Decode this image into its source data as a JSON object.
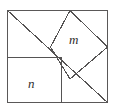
{
  "figure": {
    "type": "geometry-diagram",
    "background_color": "#ffffff",
    "stroke_color": "#555353",
    "label_color": "#2f2d2d",
    "outer_square": {
      "name": "outer-square",
      "left": 7,
      "top": 10,
      "right": 108,
      "bottom": 103
    },
    "diagonal": {
      "name": "main-diagonal",
      "x1": 7,
      "y1": 10,
      "x2": 108,
      "y2": 103
    },
    "square_n": {
      "name": "square-n",
      "left": 7,
      "top": 57,
      "right": 61,
      "bottom": 103
    },
    "diamond_m": {
      "name": "diamond-m",
      "points": "70,10 108,47 70,79 50,47"
    },
    "labels": {
      "m": "m",
      "n": "n"
    }
  }
}
